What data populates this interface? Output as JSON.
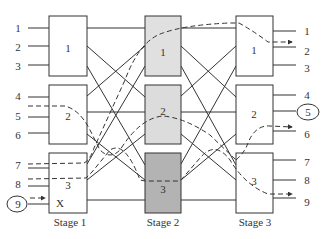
{
  "diagram": {
    "type": "three-stage Clos switching network",
    "colors": {
      "line": "#333333",
      "stage1_fill": "#ffffff",
      "stage2_box1_fill": "#e0e0e0",
      "stage2_box2_fill": "#dcdcdc",
      "stage2_box3_fill": "#b3b3b3",
      "stage3_fill": "#ffffff"
    },
    "stages": [
      {
        "label": "Stage 1",
        "boxes": [
          {
            "label": "1"
          },
          {
            "label": "2"
          },
          {
            "label": "3"
          }
        ]
      },
      {
        "label": "Stage 2",
        "boxes": [
          {
            "label": "1"
          },
          {
            "label": "2"
          },
          {
            "label": "3"
          }
        ]
      },
      {
        "label": "Stage 3",
        "boxes": [
          {
            "label": "1"
          },
          {
            "label": "2"
          },
          {
            "label": "3"
          }
        ]
      }
    ],
    "inputs": [
      "1",
      "2",
      "3",
      "4",
      "5",
      "6",
      "7",
      "8",
      "9"
    ],
    "outputs": [
      "1",
      "2",
      "3",
      "4",
      "5",
      "6",
      "7",
      "8",
      "9"
    ],
    "blocked_marker": "X",
    "circled_input": "9",
    "circled_output": "5"
  }
}
